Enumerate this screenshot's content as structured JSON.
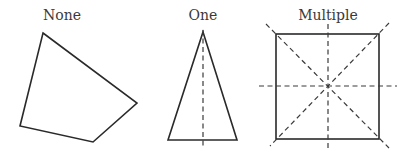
{
  "figures": [
    {
      "label": "None",
      "shape": "irregular quadrilateral",
      "symmetry_lines": 0,
      "vertices": [
        [
          43,
          33
        ],
        [
          137,
          103
        ],
        [
          93,
          142
        ],
        [
          20,
          126
        ]
      ]
    },
    {
      "label": "One",
      "shape": "isosceles triangle",
      "symmetry_lines": 1,
      "vertices": [
        [
          203,
          32
        ],
        [
          237,
          140
        ],
        [
          168,
          140
        ]
      ]
    },
    {
      "label": "Multiple",
      "shape": "square",
      "symmetry_lines": 4,
      "vertices": [
        [
          276,
          34
        ],
        [
          379,
          34
        ],
        [
          379,
          139
        ],
        [
          276,
          139
        ]
      ]
    }
  ],
  "colors": {
    "stroke": "#2a2a2a",
    "text": "#3a3a3a",
    "background": "#ffffff"
  }
}
